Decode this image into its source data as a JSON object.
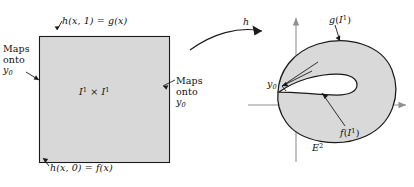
{
  "figure": {
    "background_color": "#ffffff",
    "line_color": "#1a1a1a",
    "fill_color": "#d9d9d9",
    "axis_color": "#8c8c8c"
  },
  "left_panel": {
    "region_label": {
      "text": "I1 × I1",
      "base": "I",
      "exponent": "1",
      "operator": "×"
    },
    "top_edge_label": {
      "text": "h(x, 1) = g(x)",
      "function": "h",
      "args": "(x, 1)",
      "equals": "=",
      "result": "g(x)"
    },
    "bottom_edge_label": {
      "text": "h(x, 0) = f(x)",
      "function": "h",
      "args": "(x, 0)",
      "equals": "=",
      "result": "f(x)"
    },
    "left_edge_label": {
      "line1": "Maps",
      "line2": "onto",
      "line3": "y0",
      "line3_base": "y",
      "line3_sub": "0"
    },
    "right_edge_label": {
      "line1": "Maps",
      "line2": "onto",
      "line3": "y0",
      "line3_base": "y",
      "line3_sub": "0"
    }
  },
  "map_arrow": {
    "label": "h"
  },
  "right_panel": {
    "space_label": {
      "text": "E2",
      "base": "E",
      "exponent": "2"
    },
    "g_image_label": {
      "text": "g(I1)",
      "function": "g",
      "open": "(",
      "base": "I",
      "exponent": "1",
      "close": ")"
    },
    "f_image_label": {
      "text": "f(I1)",
      "function": "f",
      "open": "(",
      "base": "I",
      "exponent": "1",
      "close": ")"
    },
    "basepoint_label": {
      "text": "y0",
      "base": "y",
      "sub": "0"
    }
  }
}
